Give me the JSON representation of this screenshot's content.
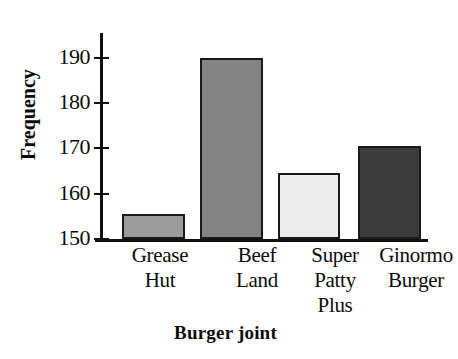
{
  "chart_data": {
    "type": "bar",
    "title": "",
    "xlabel": "Burger joint",
    "ylabel": "Frequency",
    "categories": [
      "Grease Hut",
      "Beef Land",
      "Super Patty Plus",
      "Ginormo Burger"
    ],
    "category_lines": [
      [
        "Grease",
        "Hut"
      ],
      [
        "Beef",
        "Land"
      ],
      [
        "Super",
        "Patty",
        "Plus"
      ],
      [
        "Ginormo",
        "Burger"
      ]
    ],
    "values": [
      155.5,
      190,
      164.5,
      170.5
    ],
    "ylim": [
      150,
      194
    ],
    "yticks": [
      150,
      160,
      170,
      180,
      190
    ],
    "ytick_labels": [
      "150",
      "160",
      "170",
      "180",
      "190"
    ],
    "grid": false,
    "legend": null,
    "bar_colors": [
      "#9c9c9c",
      "#848484",
      "#ededed",
      "#3b3b3b"
    ],
    "bar_edge_color": "#1a1a1a",
    "axis_color": "#101010",
    "background": "#ffffff"
  },
  "figure": {
    "title_remnant": "",
    "axis_line_color": "#101010"
  }
}
